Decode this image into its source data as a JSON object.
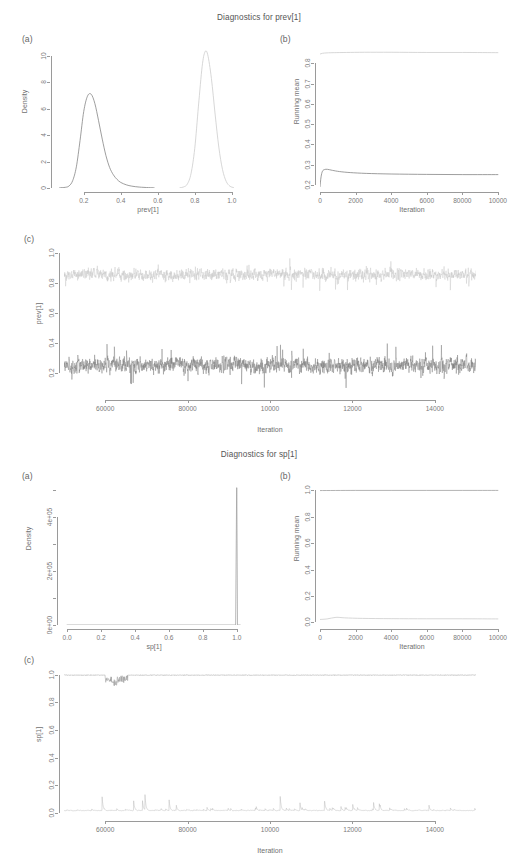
{
  "figures": [
    {
      "id": "prev",
      "title": "Diagnostics for prev[1]",
      "panels": {
        "a": {
          "tag": "(a)",
          "ylabel": "Density",
          "xlabel": "prev[1]",
          "xticks": [
            "0.2",
            "0.4",
            "0.6",
            "0.8",
            "1.0"
          ],
          "xtickvals": [
            0.2,
            0.4,
            0.6,
            0.8,
            1.0
          ],
          "yticks": [
            "0",
            "2",
            "4",
            "6",
            "8",
            "10"
          ],
          "ytickvals": [
            0,
            2,
            4,
            6,
            8,
            10
          ]
        },
        "b": {
          "tag": "(b)",
          "ylabel": "Running mean",
          "xlabel": "Iteration",
          "xticks": [
            "0",
            "2000",
            "4000",
            "6000",
            "80000",
            "10000"
          ],
          "xtickvals": [
            0,
            2000,
            4000,
            6000,
            8000,
            10000
          ],
          "yticks": [
            "0.2",
            "0.3",
            "0.4",
            "0.5",
            "0.6",
            "0.7",
            "0.8"
          ],
          "ytickvals": [
            0.2,
            0.3,
            0.4,
            0.5,
            0.6,
            0.7,
            0.8
          ]
        },
        "c": {
          "tag": "(c)",
          "ylabel": "prev[1]",
          "xlabel": "Iteration",
          "xticks": [
            "60000",
            "80000",
            "10000",
            "12000",
            "14000"
          ],
          "xtickvals": [
            6000,
            8000,
            10000,
            12000,
            14000
          ],
          "yticks": [
            "0.2",
            "0.4",
            "0.6",
            "0.8",
            "1.0"
          ],
          "ytickvals": [
            0.2,
            0.4,
            0.6,
            0.8,
            1.0
          ]
        }
      }
    },
    {
      "id": "sp",
      "title": "Diagnostics for sp[1]",
      "panels": {
        "a": {
          "tag": "(a)",
          "ylabel": "Density",
          "xlabel": "sp[1]",
          "xticks": [
            "0.0",
            "0.2",
            "0.4",
            "0.6",
            "0.8",
            "1.0"
          ],
          "xtickvals": [
            0.0,
            0.2,
            0.4,
            0.6,
            0.8,
            1.0
          ],
          "yticks": [
            "0e+00",
            "2e+05",
            "4e+05"
          ],
          "ytickvals": [
            0,
            200000,
            400000
          ]
        },
        "b": {
          "tag": "(b)",
          "ylabel": "Running mean",
          "xlabel": "Iteration",
          "xticks": [
            "0",
            "2000",
            "4000",
            "6000",
            "80000",
            "10000"
          ],
          "xtickvals": [
            0,
            2000,
            4000,
            6000,
            8000,
            10000
          ],
          "yticks": [
            "0.0",
            "0.2",
            "0.4",
            "0.6",
            "0.8",
            "1.0"
          ],
          "ytickvals": [
            0.0,
            0.2,
            0.4,
            0.6,
            0.8,
            1.0
          ]
        },
        "c": {
          "tag": "(c)",
          "ylabel": "sp[1]",
          "xlabel": "Iteration",
          "xticks": [
            "60000",
            "80000",
            "10000",
            "12000",
            "14000"
          ],
          "xtickvals": [
            6000,
            8000,
            10000,
            12000,
            14000
          ],
          "yticks": [
            "0.0",
            "0.2",
            "0.4",
            "0.6",
            "0.8",
            "1.0"
          ],
          "ytickvals": [
            0.0,
            0.2,
            0.4,
            0.6,
            0.8,
            1.0
          ]
        }
      }
    }
  ],
  "colors": {
    "chain_light": "#c9c9c9",
    "chain_dark": "#7e7e7e",
    "axis": "#9a9a9a",
    "text": "#707070",
    "background": "#ffffff"
  },
  "chart_data": [
    {
      "type": "line",
      "id": "prev-density",
      "title": "Diagnostics for prev[1]",
      "panel": "(a)",
      "xlabel": "prev[1]",
      "ylabel": "Density",
      "xlim": [
        0.05,
        1.05
      ],
      "ylim": [
        0,
        10.6
      ],
      "grid": false,
      "legend": "none",
      "series": [
        {
          "name": "chain-1-density",
          "color": "#7e7e7e",
          "comment": "unimodal kernel density, mode ~0.24 height ~7.1",
          "x": [
            0.07,
            0.1,
            0.12,
            0.14,
            0.16,
            0.18,
            0.2,
            0.22,
            0.24,
            0.26,
            0.28,
            0.3,
            0.32,
            0.34,
            0.36,
            0.38,
            0.4,
            0.43,
            0.46,
            0.5,
            0.55,
            0.58
          ],
          "y": [
            0.02,
            0.05,
            0.15,
            0.55,
            1.6,
            3.6,
            5.8,
            6.95,
            7.1,
            6.4,
            5.1,
            3.7,
            2.45,
            1.55,
            1.0,
            0.65,
            0.42,
            0.24,
            0.14,
            0.07,
            0.03,
            0.02
          ]
        },
        {
          "name": "chain-2-density",
          "color": "#c9c9c9",
          "comment": "unimodal kernel density, mode ~0.86 height ~10.3",
          "x": [
            0.72,
            0.74,
            0.76,
            0.78,
            0.8,
            0.82,
            0.84,
            0.855,
            0.87,
            0.89,
            0.91,
            0.93,
            0.95,
            0.97,
            0.99,
            1.01
          ],
          "y": [
            0.02,
            0.08,
            0.3,
            1.1,
            3.0,
            6.2,
            9.2,
            10.3,
            10.1,
            8.3,
            5.6,
            3.1,
            1.4,
            0.5,
            0.14,
            0.03
          ]
        }
      ]
    },
    {
      "type": "line",
      "id": "prev-running-mean",
      "title": "Diagnostics for prev[1]",
      "panel": "(b)",
      "xlabel": "Iteration",
      "ylabel": "Running mean",
      "xlim": [
        0,
        10400
      ],
      "ylim": [
        0.185,
        0.875
      ],
      "grid": false,
      "legend": "none",
      "series": [
        {
          "name": "chain-2-running-mean",
          "color": "#c9c9c9",
          "comment": "converges quickly to ~0.852",
          "x": [
            0,
            150,
            400,
            800,
            1500,
            2500,
            4000,
            6000,
            8000,
            10000
          ],
          "y": [
            0.845,
            0.849,
            0.851,
            0.852,
            0.853,
            0.854,
            0.854,
            0.853,
            0.853,
            0.852
          ]
        },
        {
          "name": "chain-1-running-mean",
          "color": "#7e7e7e",
          "comment": "rises from 0.19 to peak 0.277 then settles at ~0.251",
          "x": [
            0,
            60,
            140,
            260,
            420,
            700,
            1100,
            1700,
            2600,
            4000,
            6000,
            8000,
            10000
          ],
          "y": [
            0.192,
            0.24,
            0.268,
            0.276,
            0.277,
            0.272,
            0.266,
            0.261,
            0.257,
            0.254,
            0.252,
            0.251,
            0.251
          ]
        }
      ]
    },
    {
      "type": "line",
      "id": "prev-trace",
      "title": "Diagnostics for prev[1]",
      "panel": "(c)",
      "xlabel": "Iteration",
      "ylabel": "prev[1]",
      "xlim": [
        5000,
        15000
      ],
      "ylim": [
        0.05,
        1.03
      ],
      "grid": false,
      "legend": "none",
      "series": [
        {
          "name": "chain-2-trace",
          "color": "#c9c9c9",
          "mean": 0.855,
          "sd": 0.042,
          "comment": "dense MCMC trace band spanning roughly 0.70-0.98"
        },
        {
          "name": "chain-1-trace",
          "color": "#7e7e7e",
          "mean": 0.252,
          "sd": 0.058,
          "comment": "dense MCMC trace band spanning roughly 0.10-0.55"
        }
      ]
    },
    {
      "type": "line",
      "id": "sp-density",
      "title": "Diagnostics for sp[1]",
      "panel": "(a)",
      "xlabel": "sp[1]",
      "ylabel": "Density",
      "xlim": [
        -0.03,
        1.06
      ],
      "ylim": [
        0,
        520000
      ],
      "grid": false,
      "legend": "none",
      "series": [
        {
          "name": "sp-density-spike",
          "color": "#9a9a9a",
          "comment": "degenerate density: near-zero everywhere, vertical spike at x=1.0 reaching ~5.1e+05",
          "x": [
            0.0,
            0.5,
            0.96,
            0.995,
            1.0,
            1.004,
            1.01
          ],
          "y": [
            0,
            0,
            0,
            0,
            510000,
            0,
            0
          ]
        }
      ]
    },
    {
      "type": "line",
      "id": "sp-running-mean",
      "title": "Diagnostics for sp[1]",
      "panel": "(b)",
      "xlabel": "Iteration",
      "ylabel": "Running mean",
      "xlim": [
        0,
        10400
      ],
      "ylim": [
        -0.02,
        1.04
      ],
      "grid": false,
      "legend": "none",
      "series": [
        {
          "name": "sp-chain-high",
          "color": "#9a9a9a",
          "comment": "flat at 1.0",
          "x": [
            0,
            2000,
            4000,
            6000,
            8000,
            10000
          ],
          "y": [
            0.998,
            0.999,
            0.999,
            0.999,
            0.999,
            0.999
          ]
        },
        {
          "name": "sp-chain-low",
          "color": "#c9c9c9",
          "comment": "flat near 0.03 with slight early bump",
          "x": [
            0,
            400,
            900,
            1400,
            2400,
            4000,
            6000,
            8000,
            10000
          ],
          "y": [
            0.022,
            0.026,
            0.038,
            0.034,
            0.03,
            0.028,
            0.027,
            0.027,
            0.026
          ]
        }
      ]
    },
    {
      "type": "line",
      "id": "sp-trace",
      "title": "Diagnostics for sp[1]",
      "panel": "(c)",
      "xlabel": "Iteration",
      "ylabel": "sp[1]",
      "xlim": [
        5000,
        15000
      ],
      "ylim": [
        -0.03,
        1.04
      ],
      "grid": false,
      "legend": "none",
      "series": [
        {
          "name": "sp-trace-high",
          "color": "#9a9a9a",
          "mean": 0.995,
          "comment": "nearly constant at 1.0 with a brief dip near iteration 6200"
        },
        {
          "name": "sp-trace-low",
          "color": "#b5b5b5",
          "mean": 0.03,
          "comment": "near 0 with intermittent spikes up to ~0.33"
        }
      ]
    }
  ]
}
